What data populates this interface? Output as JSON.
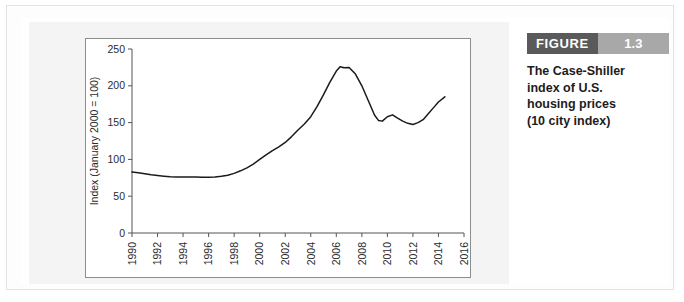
{
  "figure": {
    "badge_word": "FIGURE",
    "badge_number": "1.3",
    "badge_word_color": "#5a5a5a",
    "badge_number_color": "#a8a8a8",
    "caption_lines": [
      "The Case-Shiller",
      "index of U.S.",
      "housing prices",
      "(10 city index)"
    ]
  },
  "chart_data": {
    "type": "line",
    "title": "",
    "xlabel": "",
    "ylabel": "Index (January 2000 = 100)",
    "xlim": [
      1990,
      2016
    ],
    "ylim": [
      0,
      250
    ],
    "grid": false,
    "legend": null,
    "line_color": "#1a1a1a",
    "xticks": [
      1990,
      1992,
      1994,
      1996,
      1998,
      2000,
      2002,
      2004,
      2006,
      2008,
      2010,
      2012,
      2014,
      2016
    ],
    "xtick_labels": [
      "1990",
      "1992",
      "1994",
      "1996",
      "1998",
      "2000",
      "2002",
      "2004",
      "2006",
      "2008",
      "2010",
      "2012",
      "2014",
      "2016"
    ],
    "yticks": [
      0,
      50,
      100,
      150,
      200,
      250
    ],
    "ytick_labels": [
      "0",
      "50",
      "100",
      "150",
      "200",
      "250"
    ],
    "series": [
      {
        "name": "Case-Shiller 10-city index",
        "x": [
          1990.0,
          1990.5,
          1991.0,
          1991.5,
          1992.0,
          1992.5,
          1993.0,
          1993.5,
          1994.0,
          1994.5,
          1995.0,
          1995.5,
          1996.0,
          1996.5,
          1997.0,
          1997.5,
          1998.0,
          1998.5,
          1999.0,
          1999.5,
          2000.0,
          2000.5,
          2001.0,
          2001.5,
          2002.0,
          2002.5,
          2003.0,
          2003.5,
          2004.0,
          2004.5,
          2005.0,
          2005.5,
          2006.0,
          2006.3,
          2006.6,
          2007.0,
          2007.5,
          2008.0,
          2008.5,
          2009.0,
          2009.3,
          2009.6,
          2010.0,
          2010.4,
          2010.8,
          2011.2,
          2011.6,
          2012.0,
          2012.4,
          2012.8,
          2013.2,
          2013.6,
          2014.0,
          2014.5
        ],
        "y": [
          83.0,
          82.0,
          80.5,
          79.0,
          78.0,
          77.2,
          76.5,
          76.2,
          76.0,
          76.2,
          76.0,
          75.6,
          75.8,
          76.0,
          77.0,
          78.5,
          81.0,
          84.5,
          88.5,
          93.5,
          100.0,
          106.0,
          112.0,
          117.0,
          123.0,
          131.0,
          140.0,
          148.0,
          158.0,
          172.0,
          188.0,
          205.0,
          220.0,
          226.0,
          224.5,
          225.0,
          216.0,
          200.0,
          180.0,
          160.0,
          153.0,
          152.0,
          158.0,
          160.5,
          156.0,
          152.0,
          149.0,
          147.5,
          150.0,
          154.0,
          162.0,
          170.0,
          178.0,
          185.0
        ]
      }
    ]
  }
}
